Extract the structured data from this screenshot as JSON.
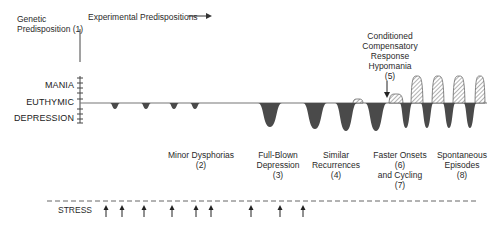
{
  "diagram": {
    "header": {
      "genetic_line1": "Genetic",
      "genetic_line2": "Predisposition (1)",
      "experimental": "Experimental Predispositions"
    },
    "axis": {
      "mania": "MANIA",
      "euthymic": "EUTHYMIC",
      "depression": "DEPRESSION"
    },
    "annotation": {
      "line1": "Conditioned",
      "line2": "Compensatory",
      "line3": "Response",
      "line4": "Hypomania",
      "line5": "(5)"
    },
    "stages": [
      {
        "line1": "Minor Dysphorias",
        "line2": "(2)"
      },
      {
        "line1": "Full-Blown",
        "line2": "Depression",
        "line3": "(3)"
      },
      {
        "line1": "Similar",
        "line2": "Recurrences",
        "line3": "(4)"
      },
      {
        "line1": "Faster Onsets",
        "line2": "(6)",
        "line3": "and Cycling",
        "line4": "(7)"
      },
      {
        "line1": "Spontaneous",
        "line2": "Episodes",
        "line3": "(8)"
      }
    ],
    "stress": {
      "label": "STRESS",
      "arrow_x": [
        106,
        122,
        144,
        172,
        196,
        211,
        251,
        280,
        303
      ]
    },
    "colors": {
      "depression_fill": "#4a4a4a",
      "baseline": "#777777",
      "text": "#2a2a2a"
    },
    "episodes": {
      "depressions": [
        {
          "x": 115,
          "w": 10,
          "d": 6
        },
        {
          "x": 146,
          "w": 10,
          "d": 6
        },
        {
          "x": 174,
          "w": 10,
          "d": 6
        },
        {
          "x": 195,
          "w": 10,
          "d": 6
        },
        {
          "x": 270,
          "w": 24,
          "d": 24
        },
        {
          "x": 315,
          "w": 24,
          "d": 26
        },
        {
          "x": 346,
          "w": 22,
          "d": 28
        },
        {
          "x": 376,
          "w": 22,
          "d": 28
        },
        {
          "x": 406,
          "w": 13,
          "d": 25
        },
        {
          "x": 427,
          "w": 13,
          "d": 25
        },
        {
          "x": 449,
          "w": 13,
          "d": 25
        },
        {
          "x": 470,
          "w": 13,
          "d": 25
        }
      ],
      "manias": [
        {
          "x": 358,
          "w": 10,
          "h": 4
        },
        {
          "x": 396,
          "w": 14,
          "h": 9
        },
        {
          "x": 417,
          "w": 12,
          "h": 27
        },
        {
          "x": 438,
          "w": 12,
          "h": 27
        },
        {
          "x": 459,
          "w": 12,
          "h": 27
        },
        {
          "x": 480,
          "w": 10,
          "h": 27
        }
      ]
    }
  }
}
